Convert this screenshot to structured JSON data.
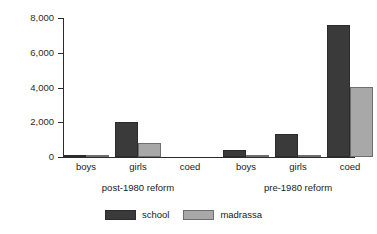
{
  "chart_data": {
    "type": "bar",
    "title": "",
    "subtitle": "",
    "xlabel": "",
    "ylabel": "",
    "ylim": [
      0,
      8000
    ],
    "grid": false,
    "legend_position": "bottom",
    "ytick_labels": [
      "0",
      "2,000",
      "4,000",
      "6,000",
      "8,000"
    ],
    "ytick_values": [
      0,
      2000,
      4000,
      6000,
      8000
    ],
    "categories": [
      "boys",
      "girls",
      "coed",
      "boys",
      "girls",
      "coed"
    ],
    "groups": [
      {
        "label": "post-1980 reform",
        "categories": [
          "boys",
          "girls",
          "coed"
        ]
      },
      {
        "label": "pre-1980 reform",
        "categories": [
          "boys",
          "girls",
          "coed"
        ]
      }
    ],
    "series": [
      {
        "name": "school",
        "color": "#3a3a3a",
        "values": [
          60,
          2000,
          0,
          420,
          1330,
          7600
        ]
      },
      {
        "name": "madrassa",
        "color": "#a8a8a8",
        "values": [
          20,
          800,
          0,
          100,
          90,
          4050
        ]
      }
    ],
    "legend": [
      {
        "label": "school",
        "color": "#3a3a3a"
      },
      {
        "label": "madrassa",
        "color": "#a8a8a8"
      }
    ]
  }
}
